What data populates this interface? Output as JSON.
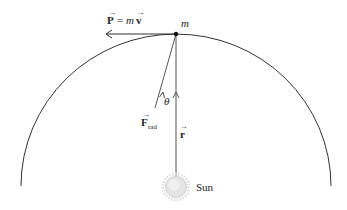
{
  "diagram": {
    "labels": {
      "momentum": "P = m",
      "momentum_vec_p": "P",
      "momentum_eq": "=",
      "momentum_m": "m",
      "momentum_v": "v",
      "mass": "m",
      "theta": "θ",
      "force": "F",
      "force_sub": "rad",
      "radius": "r",
      "sun": "Sun"
    },
    "colors": {
      "line": "#333333",
      "sun_fill": "#e6e6e6",
      "sun_rays": "#d8d8d8"
    }
  }
}
